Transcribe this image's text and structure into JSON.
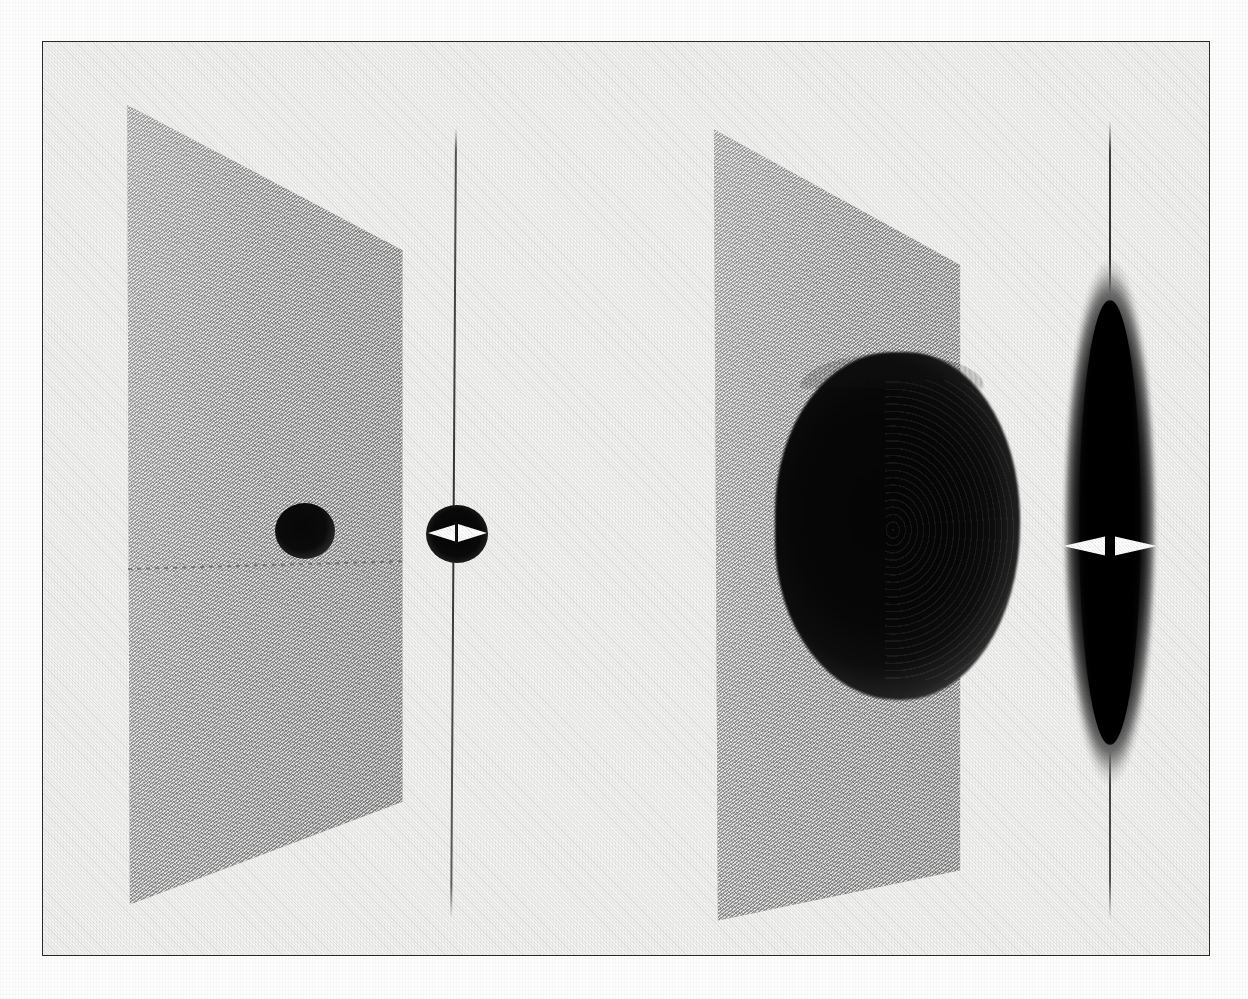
{
  "figure": {
    "title": "",
    "background_color": "#f4f4f2",
    "frame_color": "#2b2b2b",
    "ink_color": "#050505",
    "plane_fill_color": "#9d9d9d",
    "marker_color": "#ffffff",
    "panel_count": 4
  },
  "panels": [
    {
      "id": "panel-1",
      "name": "perspective-plane-left",
      "kind": "perspective-plane",
      "label": "",
      "plane": {
        "corners_pct": [
          [
            13.2,
            4.7
          ],
          [
            99.2,
            21.4
          ],
          [
            99.2,
            84.8
          ],
          [
            14.0,
            96.6
          ]
        ],
        "fill": "#9d9d9d",
        "hatched": true
      },
      "features": [
        {
          "name": "density-blob",
          "shape": "circle",
          "diameter_px": 58,
          "center_px": [
            305,
            531
          ],
          "color": "#070707"
        },
        {
          "name": "dashed-midline",
          "shape": "dashed-line",
          "y_px": 569,
          "color": "#6e6e6e"
        }
      ]
    },
    {
      "id": "panel-2",
      "name": "edge-on-view-left",
      "kind": "edge-on-projection",
      "label": "",
      "features": [
        {
          "name": "axis-line",
          "shape": "vertical-line",
          "x_px": 456,
          "color": "#3a3a3a"
        },
        {
          "name": "density-blob",
          "shape": "circle",
          "diameter_px": 60,
          "center_px": [
            457,
            534
          ],
          "color": "#050505"
        },
        {
          "name": "width-marker-left",
          "shape": "arrowhead-right",
          "color": "#ffffff"
        },
        {
          "name": "width-marker-right",
          "shape": "arrowhead-left",
          "color": "#ffffff"
        }
      ]
    },
    {
      "id": "panel-3",
      "name": "perspective-plane-right",
      "kind": "perspective-plane",
      "label": "",
      "plane": {
        "corners_pct": [
          [
            12.7,
            4.7
          ],
          [
            87.3,
            20.1
          ],
          [
            87.3,
            88.9
          ],
          [
            13.9,
            94.6
          ]
        ],
        "fill": "#9d9d9d",
        "hatched": true
      },
      "features": [
        {
          "name": "density-blob",
          "shape": "ellipse",
          "width_px": 245,
          "height_px": 348,
          "center_px": [
            897,
            526
          ],
          "color": "#050505"
        },
        {
          "name": "concentric-rings",
          "shape": "ring-pattern",
          "side": "right-limb"
        },
        {
          "name": "plume-spikes",
          "shape": "fringe",
          "side": "top"
        }
      ]
    },
    {
      "id": "panel-4",
      "name": "edge-on-view-right",
      "kind": "edge-on-projection",
      "label": "",
      "features": [
        {
          "name": "axis-line",
          "shape": "vertical-line",
          "x_px": 1110,
          "color": "#202020"
        },
        {
          "name": "density-lens",
          "shape": "lens",
          "width_px": 104,
          "height_px": 528,
          "center_px": [
            1110,
            522
          ],
          "color": "#030303"
        },
        {
          "name": "width-marker-left",
          "shape": "arrowhead-left",
          "color": "#ffffff"
        },
        {
          "name": "width-marker-right",
          "shape": "arrowhead-right",
          "color": "#ffffff"
        }
      ]
    }
  ],
  "chart_data": {
    "type": "heatmap",
    "title": "",
    "subtitle": "",
    "xlabel": "",
    "ylabel": "",
    "legend": [],
    "annotations": [],
    "grid": false,
    "panels": [
      {
        "name": "panel-1-perspective",
        "view": "perspective",
        "blob_radius_rel": 0.11,
        "blob_center_rel": [
          0.64,
          0.53
        ],
        "peak_intensity": 1.0,
        "background_intensity": 0.38
      },
      {
        "name": "panel-2-edge-on",
        "view": "edge-on",
        "blob_half_width_rel": 0.5,
        "blob_center_rel": [
          0.5,
          0.53
        ],
        "marker_separation_px": 58
      },
      {
        "name": "panel-3-perspective",
        "view": "perspective",
        "blob_radius_rel": 0.42,
        "blob_center_rel": [
          0.68,
          0.52
        ],
        "peak_intensity": 1.0,
        "background_intensity": 0.38
      },
      {
        "name": "panel-4-edge-on",
        "view": "edge-on",
        "blob_half_width_rel": 0.5,
        "blob_center_rel": [
          0.5,
          0.52
        ],
        "marker_separation_px": 96
      }
    ]
  }
}
